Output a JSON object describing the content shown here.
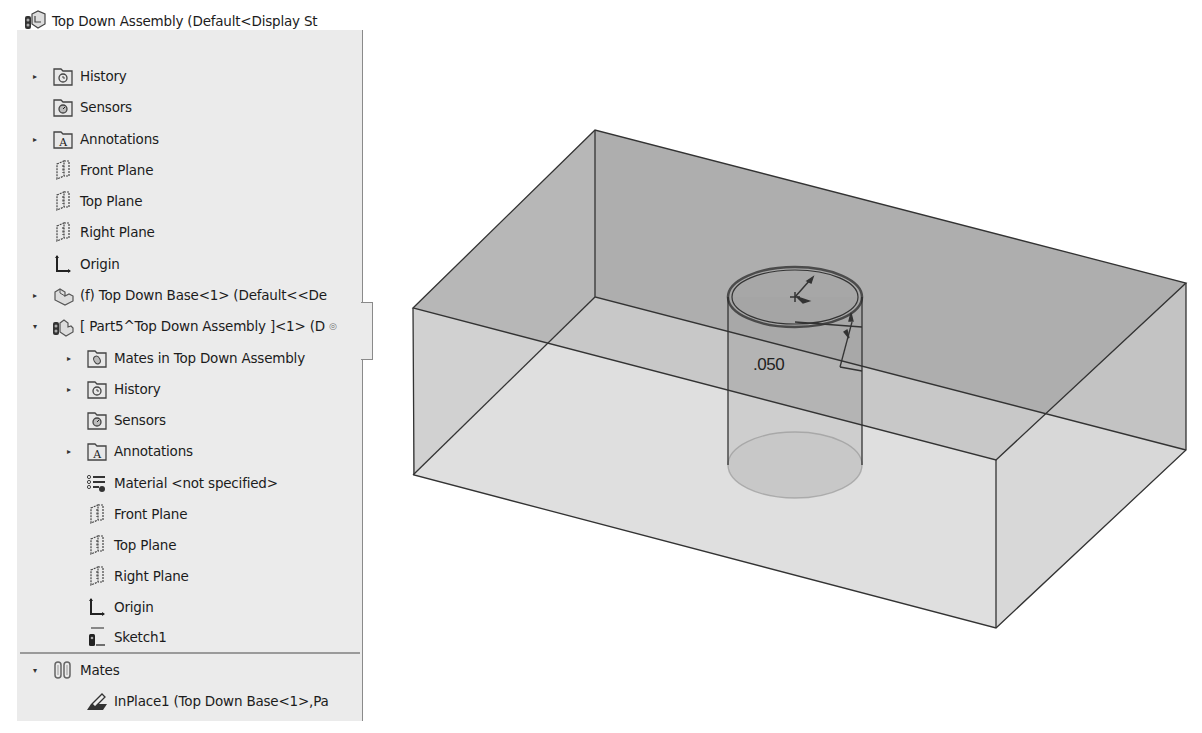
{
  "feature_tree": {
    "root": {
      "label": "Top Down Assembly  (Default<Display St",
      "icon": "assembly-icon"
    },
    "items": [
      {
        "label": "History",
        "icon": "history-folder-icon",
        "indent": 1,
        "expander": "collapsed"
      },
      {
        "label": "Sensors",
        "icon": "sensors-folder-icon",
        "indent": 1,
        "expander": "none"
      },
      {
        "label": "Annotations",
        "icon": "annotations-folder-icon",
        "indent": 1,
        "expander": "collapsed"
      },
      {
        "label": "Front Plane",
        "icon": "plane-icon",
        "indent": 1,
        "expander": "none"
      },
      {
        "label": "Top Plane",
        "icon": "plane-icon",
        "indent": 1,
        "expander": "none"
      },
      {
        "label": "Right Plane",
        "icon": "plane-icon",
        "indent": 1,
        "expander": "none"
      },
      {
        "label": "Origin",
        "icon": "origin-icon",
        "indent": 1,
        "expander": "none"
      },
      {
        "label": "(f) Top Down Base<1> (Default<<De",
        "icon": "part-icon",
        "indent": 1,
        "expander": "collapsed"
      },
      {
        "label": "[ Part5^Top Down Assembly ]<1> (D",
        "icon": "virtual-part-icon",
        "indent": 1,
        "expander": "expanded"
      },
      {
        "label": "Mates in Top Down Assembly",
        "icon": "mates-folder-icon",
        "indent": 2,
        "expander": "collapsed"
      },
      {
        "label": "History",
        "icon": "history-folder-icon",
        "indent": 2,
        "expander": "collapsed"
      },
      {
        "label": "Sensors",
        "icon": "sensors-folder-icon",
        "indent": 2,
        "expander": "none"
      },
      {
        "label": "Annotations",
        "icon": "annotations-folder-icon",
        "indent": 2,
        "expander": "collapsed"
      },
      {
        "label": "Material <not specified>",
        "icon": "material-icon",
        "indent": 2,
        "expander": "none"
      },
      {
        "label": "Front Plane",
        "icon": "plane-icon",
        "indent": 2,
        "expander": "none"
      },
      {
        "label": "Top Plane",
        "icon": "plane-icon",
        "indent": 2,
        "expander": "none"
      },
      {
        "label": "Right Plane",
        "icon": "plane-icon",
        "indent": 2,
        "expander": "none"
      },
      {
        "label": "Origin",
        "icon": "origin-icon",
        "indent": 2,
        "expander": "none"
      },
      {
        "label": "Sketch1",
        "icon": "sketch-icon",
        "indent": 2,
        "expander": "none"
      }
    ],
    "mates": {
      "folder": {
        "label": "Mates",
        "icon": "mates-icon",
        "expander": "expanded"
      },
      "items": [
        {
          "label": "InPlace1 (Top Down Base<1>,Pa",
          "icon": "inplace-mate-icon"
        }
      ]
    }
  },
  "viewport": {
    "dimension_value": ".050",
    "colors": {
      "box_top": "#a9a9a9",
      "box_front": "#d7d7d7",
      "box_right": "#d2d2d2",
      "edge": "#333333",
      "cylinder": "#9d9d9d"
    }
  }
}
